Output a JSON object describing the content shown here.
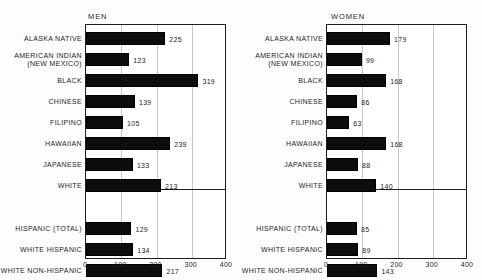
{
  "figure": {
    "clipped_title": "",
    "axis": {
      "min": 0,
      "max": 400,
      "ticks": [
        "0",
        "100",
        "200",
        "300",
        "400"
      ]
    }
  },
  "panels": [
    {
      "id": "men",
      "title": "MEN",
      "groups": [
        {
          "rows": [
            {
              "label": "ALASKA NATIVE",
              "value": 225,
              "value_label": "225"
            },
            {
              "label": "AMERICAN INDIAN\n(NEW MEXICO)",
              "value": 123,
              "value_label": "123"
            },
            {
              "label": "BLACK",
              "value": 319,
              "value_label": "319"
            },
            {
              "label": "CHINESE",
              "value": 139,
              "value_label": "139"
            },
            {
              "label": "FILIPINO",
              "value": 105,
              "value_label": "105"
            },
            {
              "label": "HAWAIIAN",
              "value": 239,
              "value_label": "239"
            },
            {
              "label": "JAPANESE",
              "value": 133,
              "value_label": "133"
            },
            {
              "label": "WHITE",
              "value": 213,
              "value_label": "213"
            }
          ]
        },
        {
          "rows": [
            {
              "label": "HISPANIC (TOTAL)",
              "value": 129,
              "value_label": "129"
            },
            {
              "label": "WHITE HISPANIC",
              "value": 134,
              "value_label": "134"
            },
            {
              "label": "WHITE NON-HISPANIC",
              "value": 217,
              "value_label": "217"
            }
          ]
        }
      ]
    },
    {
      "id": "women",
      "title": "WOMEN",
      "groups": [
        {
          "rows": [
            {
              "label": "ALASKA NATIVE",
              "value": 179,
              "value_label": "179"
            },
            {
              "label": "AMERICAN INDIAN\n(NEW MEXICO)",
              "value": 99,
              "value_label": "99"
            },
            {
              "label": "BLACK",
              "value": 168,
              "value_label": "168"
            },
            {
              "label": "CHINESE",
              "value": 86,
              "value_label": "86"
            },
            {
              "label": "FILIPINO",
              "value": 63,
              "value_label": "63"
            },
            {
              "label": "HAWAIIAN",
              "value": 168,
              "value_label": "168"
            },
            {
              "label": "JAPANESE",
              "value": 88,
              "value_label": "88"
            },
            {
              "label": "WHITE",
              "value": 140,
              "value_label": "140"
            }
          ]
        },
        {
          "rows": [
            {
              "label": "HISPANIC (TOTAL)",
              "value": 85,
              "value_label": "85"
            },
            {
              "label": "WHITE HISPANIC",
              "value": 89,
              "value_label": "89"
            },
            {
              "label": "WHITE NON-HISPANIC",
              "value": 143,
              "value_label": "143"
            }
          ]
        }
      ]
    }
  ],
  "chart_data": {
    "type": "bar",
    "orientation": "horizontal",
    "title": "",
    "xlabel": "",
    "ylabel": "",
    "xlim": [
      0,
      400
    ],
    "xticks": [
      0,
      100,
      200,
      300,
      400
    ],
    "grid": true,
    "legend": "none",
    "panels": [
      "MEN",
      "WOMEN"
    ],
    "categories": [
      "ALASKA NATIVE",
      "AMERICAN INDIAN (NEW MEXICO)",
      "BLACK",
      "CHINESE",
      "FILIPINO",
      "HAWAIIAN",
      "JAPANESE",
      "WHITE",
      "HISPANIC (TOTAL)",
      "WHITE HISPANIC",
      "WHITE NON-HISPANIC"
    ],
    "series": [
      {
        "name": "MEN",
        "values": [
          225,
          123,
          319,
          139,
          105,
          239,
          133,
          213,
          129,
          134,
          217
        ]
      },
      {
        "name": "WOMEN",
        "values": [
          179,
          99,
          168,
          86,
          63,
          168,
          88,
          140,
          85,
          89,
          143
        ]
      }
    ]
  }
}
